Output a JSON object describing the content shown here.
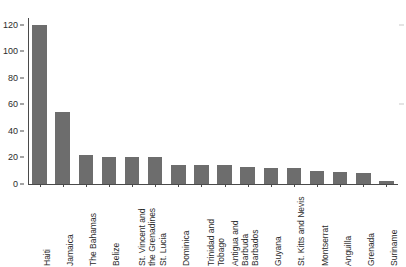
{
  "chart_data": {
    "type": "bar",
    "title": "",
    "subtitle": "",
    "xlabel": "",
    "ylabel": "",
    "ylim": [
      0,
      125
    ],
    "grid": false,
    "legend": null,
    "bar_color": "#6d6d6d",
    "axis_color": "#4a4a4a",
    "yticks": [
      0,
      20,
      40,
      60,
      80,
      100,
      120
    ],
    "ytick_labels": [
      "0",
      "20",
      "40",
      "60",
      "80",
      "100",
      "120"
    ],
    "categories": [
      "Haiti",
      "Jamaica",
      "The Bahamas",
      "Belize",
      "St. Vincent and the Grenadines",
      "St. Lucia",
      "Dominica",
      "Trinidad and Tobago",
      "Antigua and Barbuda",
      "Barbados",
      "Guyana",
      "St. Kitts and Nevis",
      "Montserrat",
      "Anguilla",
      "Grenada",
      "Suriname"
    ],
    "category_lines": [
      [
        "Haiti"
      ],
      [
        "Jamaica"
      ],
      [
        "The Bahamas"
      ],
      [
        "Belize"
      ],
      [
        "St. Vincent and",
        "the Grenadines"
      ],
      [
        "St. Lucia"
      ],
      [
        "Dominica"
      ],
      [
        "Trinidad and",
        "Tobago"
      ],
      [
        "Antigua and",
        "Barbuda"
      ],
      [
        "Barbados"
      ],
      [
        "Guyana"
      ],
      [
        "St. Kitts and Nevis"
      ],
      [
        "Montserrat"
      ],
      [
        "Anguilla"
      ],
      [
        "Grenada"
      ],
      [
        "Suriname"
      ]
    ],
    "values": [
      120,
      54,
      22,
      20,
      20,
      20,
      14,
      14,
      14,
      13,
      12,
      12,
      10,
      9,
      8,
      2
    ]
  }
}
